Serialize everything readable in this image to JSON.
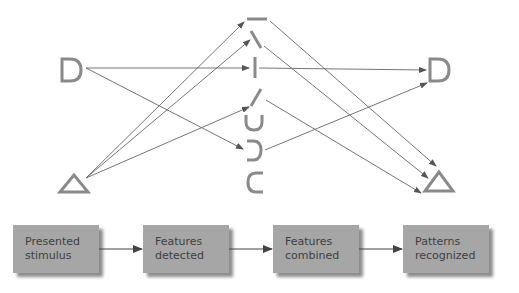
{
  "diagram": {
    "inputs": [
      {
        "id": "D",
        "label": "D"
      },
      {
        "id": "triangle",
        "label": "△"
      }
    ],
    "features": [
      {
        "id": "horizontal-line",
        "label": "—"
      },
      {
        "id": "backslash-line",
        "label": "\\"
      },
      {
        "id": "vertical-line",
        "label": "|"
      },
      {
        "id": "slash-line",
        "label": "/"
      },
      {
        "id": "u-curve",
        "label": "∪"
      },
      {
        "id": "right-curve",
        "label": "⊃"
      },
      {
        "id": "left-curve",
        "label": "⊂"
      }
    ],
    "outputs": [
      {
        "id": "D",
        "label": "D"
      },
      {
        "id": "triangle",
        "label": "△"
      }
    ],
    "edges": [
      {
        "from": "input-D",
        "to": "vertical-line"
      },
      {
        "from": "input-D",
        "to": "right-curve"
      },
      {
        "from": "input-triangle",
        "to": "horizontal-line"
      },
      {
        "from": "input-triangle",
        "to": "backslash-line"
      },
      {
        "from": "input-triangle",
        "to": "slash-line"
      },
      {
        "from": "vertical-line",
        "to": "output-D"
      },
      {
        "from": "right-curve",
        "to": "output-D"
      },
      {
        "from": "horizontal-line",
        "to": "output-triangle"
      },
      {
        "from": "backslash-line",
        "to": "output-triangle"
      },
      {
        "from": "slash-line",
        "to": "output-triangle"
      }
    ]
  },
  "flow": {
    "steps": [
      {
        "line1": "Presented",
        "line2": "stimulus"
      },
      {
        "line1": "Features",
        "line2": "detected"
      },
      {
        "line1": "Features",
        "line2": "combined"
      },
      {
        "line1": "Patterns",
        "line2": "recognized"
      }
    ]
  },
  "colors": {
    "glyph": "#8a8a8a",
    "arrow": "#555555",
    "box_fill": "#a6a6a6",
    "box_shadow": "#8d8d8d",
    "box_text": "#3f3f3f",
    "background": "#ffffff"
  }
}
